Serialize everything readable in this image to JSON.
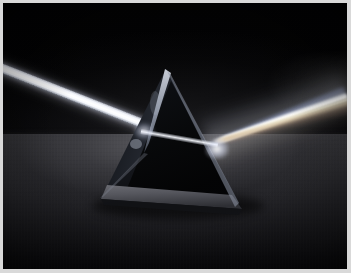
{
  "image": {
    "title": "Light dispersion through a triangular glass prism",
    "subject": "optical prism",
    "alt_text": "A white light beam enters a triangular glass prism from the upper left, refracts through the glass, and exits as a fanned spectrum toward the upper right across a dark studio backdrop.",
    "orientation": "landscape",
    "width_px": 351,
    "height_px": 273
  },
  "frame": {
    "border_color": "#d9d9d9",
    "border_width_px": 3,
    "canvas_background": "#000000"
  },
  "scene": {
    "background_label": "dark studio backdrop",
    "background_color": "#020203",
    "surface_label": "gray tabletop",
    "surface_color": "#3a3a3e",
    "surface_shadow_color": "#0d0d10",
    "horizon_y_px": 131,
    "lighting": "single collimated beam, low-key studio"
  },
  "beams": {
    "incident": {
      "label": "incident white light beam",
      "color": "#ffffff",
      "entry_point": {
        "x": 0,
        "y": 61
      },
      "strike_point": {
        "x": 140,
        "y": 128
      },
      "angle_deg": 21.5,
      "thickness_px": 8.5
    },
    "internal": {
      "label": "refracted beam inside glass",
      "color": "#f8faff",
      "from": {
        "x": 140,
        "y": 128
      },
      "to": {
        "x": 213,
        "y": 141
      },
      "angle_deg": 10
    },
    "exit": {
      "label": "dispersed spectrum fan",
      "origin": {
        "x": 213,
        "y": 141
      },
      "spread_angle_deg": 9,
      "mean_angle_deg": -19
    }
  },
  "spectrum": {
    "label": "dispersed spectrum bands",
    "note": "low-saturation photographic spectrum; bands read as near-white with warm and cool tints",
    "bands": [
      {
        "name": "violet-blue",
        "color": "#8e9fd4",
        "offset_deg": -3.8,
        "width_px": 3.0,
        "opacity": 0.45,
        "blur_px": 2.2
      },
      {
        "name": "blue",
        "color": "#a9b6e0",
        "offset_deg": -2.4,
        "width_px": 3.4,
        "opacity": 0.58,
        "blur_px": 1.9
      },
      {
        "name": "cyan-white",
        "color": "#d6dff2",
        "offset_deg": -1.1,
        "width_px": 4.0,
        "opacity": 0.74,
        "blur_px": 1.5
      },
      {
        "name": "white-core",
        "color": "#ffffff",
        "offset_deg": 0.0,
        "width_px": 5.2,
        "opacity": 0.98,
        "blur_px": 0.8
      },
      {
        "name": "pale-yellow",
        "color": "#f6f2dd",
        "offset_deg": 1.2,
        "width_px": 4.4,
        "opacity": 0.86,
        "blur_px": 1.2
      },
      {
        "name": "amber",
        "color": "#e5d6b4",
        "offset_deg": 2.5,
        "width_px": 3.8,
        "opacity": 0.68,
        "blur_px": 1.7
      },
      {
        "name": "orange-red",
        "color": "#cbae8e",
        "offset_deg": 3.9,
        "width_px": 3.2,
        "opacity": 0.5,
        "blur_px": 2.1
      },
      {
        "name": "deep-red",
        "color": "#a8826a",
        "offset_deg": 5.3,
        "width_px": 2.6,
        "opacity": 0.34,
        "blur_px": 2.6
      }
    ]
  },
  "prism": {
    "label": "triangular glass prism",
    "material": "optical glass",
    "apex": {
      "x": 163,
      "y": 66
    },
    "front_left_foot": {
      "x": 98,
      "y": 196
    },
    "front_right_foot": {
      "x": 239,
      "y": 206
    },
    "back_left_foot": {
      "x": 112,
      "y": 168
    },
    "faces": [
      {
        "name": "front-face",
        "fill": "#1b1d22"
      },
      {
        "name": "left-entry-face",
        "fill": "#101216"
      },
      {
        "name": "base-band",
        "fill": "#4a4b50"
      },
      {
        "name": "inner-triangle",
        "fill": "#070809"
      }
    ],
    "edge_highlight_color": "#cfd6e4"
  }
}
